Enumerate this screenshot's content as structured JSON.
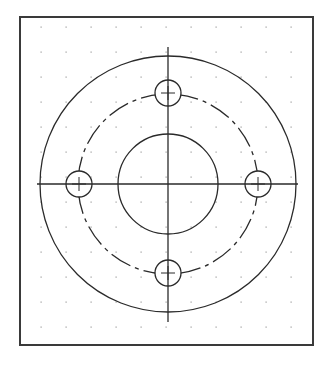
{
  "drawing": {
    "title": "Flange plate with four bolt holes",
    "colors": {
      "background": "#ffffff",
      "frame": "#3a3a3a",
      "stroke": "#2a2a2a",
      "grid_dot": "#9a9a9a"
    },
    "frame": {
      "x": 20,
      "y": 17,
      "width": 293,
      "height": 328,
      "stroke_width": 2
    },
    "grid": {
      "start_x": 41,
      "start_y": 27,
      "spacing": 25,
      "cols": 11,
      "rows": 13
    },
    "center": {
      "x": 168,
      "y": 184
    },
    "outer_circle": {
      "r": 128,
      "style": "solid"
    },
    "bolt_circle": {
      "r": 90,
      "style": "dashed"
    },
    "inner_circle": {
      "r": 50,
      "style": "solid"
    },
    "holes": [
      {
        "name": "top",
        "cx": 168,
        "cy": 93,
        "r": 13
      },
      {
        "name": "left",
        "cx": 79,
        "cy": 184,
        "r": 13
      },
      {
        "name": "right",
        "cx": 258,
        "cy": 184,
        "r": 13
      },
      {
        "name": "bottom",
        "cx": 168,
        "cy": 273,
        "r": 13
      }
    ],
    "centerlines": {
      "vertical": {
        "x": 168,
        "y1": 47,
        "y2": 322
      },
      "horizontal": {
        "y": 184,
        "x1": 37,
        "x2": 298
      }
    }
  }
}
